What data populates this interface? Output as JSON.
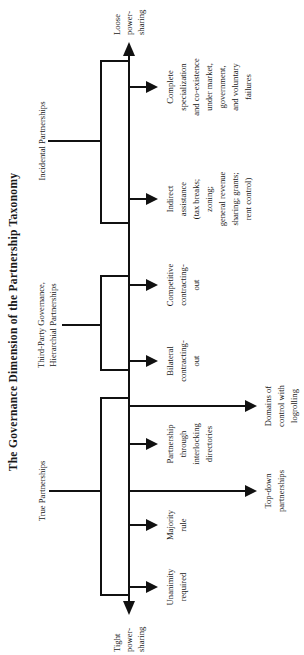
{
  "figure": {
    "title": "The Governance Dimension of the Partnership Taxonomy",
    "orientation": "rotated 90° counter-clockwise (reads bottom-to-top)",
    "poles": {
      "loose": [
        "Loose",
        "power-",
        "sharing"
      ],
      "tight": [
        "Tight",
        "power-",
        "sharing"
      ]
    },
    "groups": [
      {
        "id": "incidental",
        "label_lines": [
          "Incidental Partnerships"
        ],
        "leaves": [
          {
            "id": "complete-specialization",
            "lines": [
              "Complete",
              "specialization",
              "and co-existence",
              "under market,",
              "government,",
              "and voluntary",
              "failures"
            ],
            "long": false
          },
          {
            "id": "indirect-assistance",
            "lines": [
              "Indirect",
              "assistance",
              "(tax breaks;",
              "zoning;",
              "general revenue",
              "sharing; grants;",
              "rent control)"
            ],
            "long": false
          }
        ]
      },
      {
        "id": "third-party",
        "label_lines": [
          "Third-Party Governance,",
          "Hierarchial Partnerships"
        ],
        "leaves": [
          {
            "id": "competitive-contracting-out",
            "lines": [
              "Competitive",
              "contracting-",
              "out"
            ],
            "long": false
          },
          {
            "id": "bilateral-contracting-out",
            "lines": [
              "Bilateral",
              "contracting-",
              "out"
            ],
            "long": false
          }
        ]
      },
      {
        "id": "true",
        "label_lines": [
          "True Partnerships"
        ],
        "leaves": [
          {
            "id": "domains-of-control",
            "lines": [
              "Domains of",
              "control with",
              "logrolling"
            ],
            "long": true
          },
          {
            "id": "interlocking-directories",
            "lines": [
              "Partnership",
              "through",
              "interlocking",
              "directories"
            ],
            "long": false
          },
          {
            "id": "top-down",
            "lines": [
              "Top-down",
              "partnerships"
            ],
            "long": true
          },
          {
            "id": "majority-rule",
            "lines": [
              "Majority",
              "rule"
            ],
            "long": false
          },
          {
            "id": "unanimity-required",
            "lines": [
              "Unanimity",
              "required"
            ],
            "long": false
          }
        ]
      }
    ]
  },
  "labels": {
    "title": "The Governance Dimension of the Partnership Taxonomy",
    "loose_1": "Loose",
    "loose_2": "power-",
    "loose_3": "sharing",
    "tight_1": "Tight",
    "tight_2": "power-",
    "tight_3": "sharing",
    "g_incidental": "Incidental Partnerships",
    "g_third_1": "Third-Party Governance,",
    "g_third_2": "Hierarchial Partnerships",
    "g_true": "True Partnerships",
    "cs_1": "Complete",
    "cs_2": "specialization",
    "cs_3": "and co-existence",
    "cs_4": "under market,",
    "cs_5": "government,",
    "cs_6": "and voluntary",
    "cs_7": "failures",
    "ia_1": "Indirect",
    "ia_2": "assistance",
    "ia_3": "(tax breaks;",
    "ia_4": "zoning;",
    "ia_5": "general revenue",
    "ia_6": "sharing; grants;",
    "ia_7": "rent control)",
    "cc_1": "Competitive",
    "cc_2": "contracting-",
    "cc_3": "out",
    "bc_1": "Bilateral",
    "bc_2": "contracting-",
    "bc_3": "out",
    "dc_1": "Domains of",
    "dc_2": "control with",
    "dc_3": "logrolling",
    "pi_1": "Partnership",
    "pi_2": "through",
    "pi_3": "interlocking",
    "pi_4": "directories",
    "td_1": "Top-down",
    "td_2": "partnerships",
    "mr_1": "Majority",
    "mr_2": "rule",
    "ur_1": "Unanimity",
    "ur_2": "required"
  }
}
